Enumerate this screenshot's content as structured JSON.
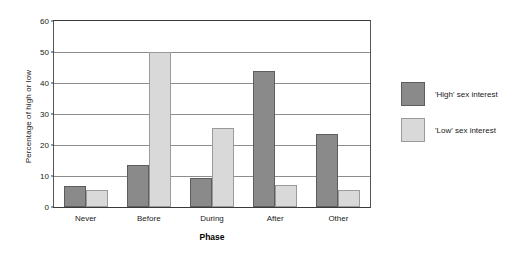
{
  "chart_data": {
    "type": "bar",
    "title": "",
    "xlabel": "Phase",
    "ylabel": "Percentage of high or low",
    "categories": [
      "Never",
      "Before",
      "During",
      "After",
      "Other"
    ],
    "series": [
      {
        "name": "'High' sex interest",
        "color": "#8a8a8a",
        "values": [
          6.7,
          13.5,
          9.3,
          44.0,
          23.5
        ]
      },
      {
        "name": "'Low' sex interest",
        "color": "#d9d9d9",
        "values": [
          5.5,
          50.0,
          25.5,
          7.0,
          5.5
        ]
      }
    ],
    "ylim": [
      0,
      60
    ],
    "yticks": [
      0,
      10,
      20,
      30,
      40,
      50,
      60
    ],
    "ytick_labels": [
      "0",
      "10",
      "20",
      "30",
      "40",
      "50",
      "60"
    ],
    "grid": true,
    "legend_position": "right"
  }
}
